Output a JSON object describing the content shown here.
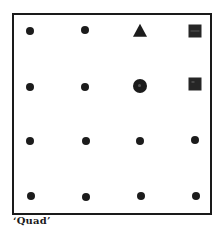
{
  "figure": {
    "caption": "‘Quad’",
    "grid": {
      "rows": 4,
      "cols": 4,
      "cells": [
        [
          {
            "shape": "dot",
            "x": 30,
            "y": 31
          },
          {
            "shape": "dot",
            "x": 85,
            "y": 30
          },
          {
            "shape": "triangle",
            "x": 140,
            "y": 31
          },
          {
            "shape": "square",
            "variant": "lined",
            "x": 195,
            "y": 31
          }
        ],
        [
          {
            "shape": "dot",
            "x": 30,
            "y": 87
          },
          {
            "shape": "dot",
            "x": 85,
            "y": 87
          },
          {
            "shape": "circle",
            "x": 140,
            "y": 86
          },
          {
            "shape": "square",
            "variant": "marked",
            "x": 195,
            "y": 84
          }
        ],
        [
          {
            "shape": "dot",
            "x": 30,
            "y": 141
          },
          {
            "shape": "dot",
            "x": 86,
            "y": 141
          },
          {
            "shape": "dot",
            "x": 140,
            "y": 141
          },
          {
            "shape": "dot",
            "x": 195,
            "y": 140
          }
        ],
        [
          {
            "shape": "dot",
            "x": 31,
            "y": 196
          },
          {
            "shape": "dot",
            "x": 86,
            "y": 197
          },
          {
            "shape": "dot",
            "x": 141,
            "y": 196
          },
          {
            "shape": "dot",
            "x": 196,
            "y": 196
          }
        ]
      ]
    },
    "colors": {
      "ink": "#1c1c1c",
      "background": "#ffffff"
    }
  }
}
